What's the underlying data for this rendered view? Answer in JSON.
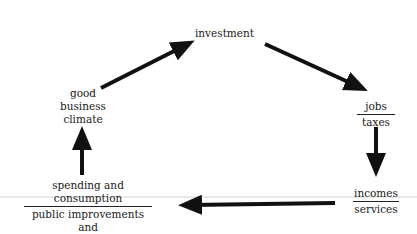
{
  "diagram": {
    "nodes": {
      "investment": {
        "text": "investment"
      },
      "climate": {
        "lines": [
          "good",
          "business",
          "climate"
        ]
      },
      "jobs_taxes": {
        "top": "jobs",
        "bottom": "taxes"
      },
      "incomes_services": {
        "top": "incomes",
        "bottom": "services"
      },
      "spending": {
        "top_lines": [
          "spending and",
          "consumption"
        ],
        "bottom_lines": [
          "public improvements and",
          "neighborhood services"
        ]
      }
    },
    "edges": [
      {
        "from": "good business climate",
        "to": "investment"
      },
      {
        "from": "investment",
        "to": "jobs / taxes"
      },
      {
        "from": "jobs / taxes",
        "to": "incomes / services"
      },
      {
        "from": "incomes / services",
        "to": "spending and consumption / public improvements and neighborhood services"
      },
      {
        "from": "spending and consumption / public improvements and neighborhood services",
        "to": "good business climate"
      }
    ]
  }
}
